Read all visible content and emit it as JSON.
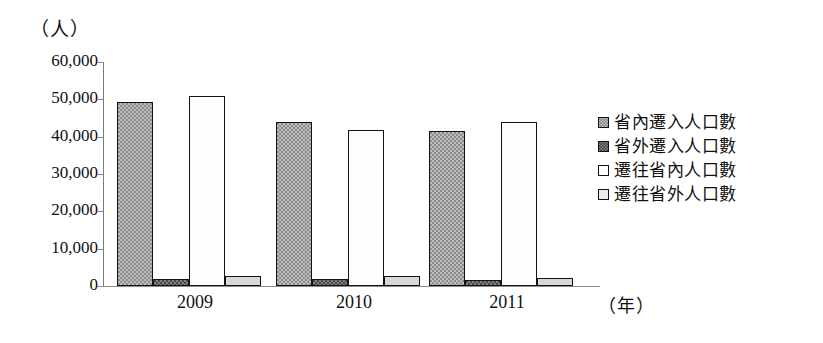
{
  "chart_data": {
    "type": "bar",
    "title": "",
    "subtitle": "",
    "xlabel": "（年）",
    "ylabel": "（人）",
    "categories": [
      "2009",
      "2010",
      "2011"
    ],
    "series": [
      {
        "name": "省內遷入人口數",
        "values": [
          49200,
          44000,
          41500
        ],
        "swatch": "s1"
      },
      {
        "name": "省外遷入人口數",
        "values": [
          2000,
          2000,
          1700
        ],
        "swatch": "s2"
      },
      {
        "name": "遷往省內人口數",
        "values": [
          51000,
          41800,
          44000
        ],
        "swatch": "s3"
      },
      {
        "name": "遷往省外人口數",
        "values": [
          2600,
          2600,
          2100
        ],
        "swatch": "s4"
      }
    ],
    "ylim": [
      0,
      60000
    ],
    "ytick_values": [
      0,
      10000,
      20000,
      30000,
      40000,
      50000,
      60000
    ],
    "ytick_labels": [
      "0",
      "10,000",
      "20,000",
      "30,000",
      "40,000",
      "50,000",
      "60,000"
    ],
    "grid": false,
    "legend_position": "right",
    "colors": {
      "series_1": "#8d8d8d",
      "series_2": "#4a4a4a",
      "series_3": "#ffffff",
      "series_4": "#d8d8d8",
      "outline": "#121212",
      "axis": "#8c8c8c",
      "text": "#111111",
      "background": "#ffffff"
    }
  }
}
